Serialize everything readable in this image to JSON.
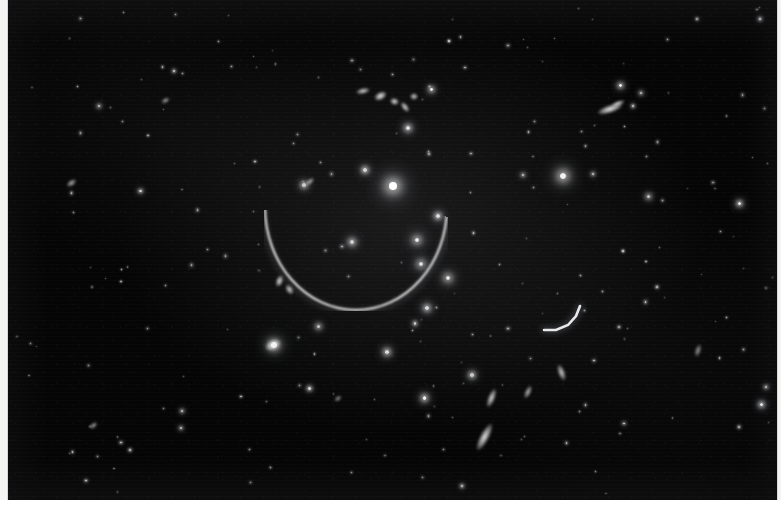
{
  "image": {
    "kind": "astronomical-photograph",
    "subject": "galaxy cluster with gravitational lensing arcs",
    "plate": {
      "x": 8,
      "y": 0,
      "width": 769,
      "height": 500,
      "background_color": "#050505",
      "border_color": "#d8d8d4"
    },
    "page_background_color": "#ffffff",
    "paper_tint_color": "#f4f4f2",
    "star_color": "#ffffff",
    "arc_color": "#f2f4f8",
    "caption": ""
  },
  "features": {
    "giant_arc": {
      "name": "giant-tangential-arc",
      "cx": 348,
      "cy": 207,
      "rx": 92,
      "ry": 104,
      "start_deg": 96,
      "end_deg": 268,
      "brightness": "bright"
    },
    "arc_knots": [
      {
        "x": 372,
        "y": 96,
        "w": 13,
        "h": 8,
        "rot": -28,
        "b": 0.95
      },
      {
        "x": 386,
        "y": 101,
        "w": 9,
        "h": 7,
        "rot": 15,
        "b": 0.9
      },
      {
        "x": 397,
        "y": 107,
        "w": 12,
        "h": 6,
        "rot": 52,
        "b": 0.88
      },
      {
        "x": 406,
        "y": 96,
        "w": 8,
        "h": 7,
        "rot": 0,
        "b": 0.8
      },
      {
        "x": 355,
        "y": 91,
        "w": 14,
        "h": 6,
        "rot": -12,
        "b": 0.85
      },
      {
        "x": 271,
        "y": 281,
        "w": 7,
        "h": 12,
        "rot": 20,
        "b": 0.9
      },
      {
        "x": 281,
        "y": 289,
        "w": 11,
        "h": 7,
        "rot": 58,
        "b": 0.82
      }
    ],
    "secondary_arc": {
      "name": "secondary-arc-right",
      "points": "M 572,306 L 568,316 L 560,325 L 548,330 L 536,330",
      "brightness": "medium"
    },
    "brightest_cluster_galaxy": {
      "x": 385,
      "y": 186,
      "size": 26,
      "brightness": 1.0
    },
    "bright_galaxies": [
      {
        "x": 385,
        "y": 186,
        "s": 26,
        "b": 1.0
      },
      {
        "x": 555,
        "y": 176,
        "s": 21,
        "b": 0.95
      },
      {
        "x": 409,
        "y": 240,
        "s": 16,
        "b": 0.92
      },
      {
        "x": 413,
        "y": 264,
        "s": 14,
        "b": 0.88
      },
      {
        "x": 440,
        "y": 278,
        "s": 15,
        "b": 0.9
      },
      {
        "x": 400,
        "y": 128,
        "s": 12,
        "b": 0.86
      },
      {
        "x": 430,
        "y": 216,
        "s": 11,
        "b": 0.84
      },
      {
        "x": 266,
        "y": 345,
        "s": 18,
        "b": 0.88
      },
      {
        "x": 344,
        "y": 242,
        "s": 13,
        "b": 0.82
      },
      {
        "x": 379,
        "y": 352,
        "s": 12,
        "b": 0.86
      },
      {
        "x": 419,
        "y": 308,
        "s": 12,
        "b": 0.84
      },
      {
        "x": 296,
        "y": 185,
        "s": 11,
        "b": 0.78
      },
      {
        "x": 310,
        "y": 326,
        "s": 10,
        "b": 0.8
      },
      {
        "x": 357,
        "y": 170,
        "s": 11,
        "b": 0.82
      },
      {
        "x": 464,
        "y": 375,
        "s": 11,
        "b": 0.78
      },
      {
        "x": 640,
        "y": 196,
        "s": 10,
        "b": 0.78
      }
    ],
    "field_stars_count": 120,
    "edge_on_galaxies": [
      {
        "x": 602,
        "y": 109,
        "w": 26,
        "h": 8,
        "rot": -18,
        "b": 0.95
      },
      {
        "x": 476,
        "y": 437,
        "w": 9,
        "h": 30,
        "rot": 28,
        "b": 0.9
      },
      {
        "x": 483,
        "y": 398,
        "w": 7,
        "h": 20,
        "rot": 22,
        "b": 0.85
      },
      {
        "x": 553,
        "y": 372,
        "w": 7,
        "h": 17,
        "rot": -20,
        "b": 0.8
      },
      {
        "x": 63,
        "y": 183,
        "w": 11,
        "h": 6,
        "rot": -35,
        "b": 0.7
      },
      {
        "x": 157,
        "y": 100,
        "w": 9,
        "h": 5,
        "rot": -30,
        "b": 0.66
      },
      {
        "x": 610,
        "y": 103,
        "w": 14,
        "h": 5,
        "rot": -20,
        "b": 0.9
      },
      {
        "x": 302,
        "y": 181,
        "w": 10,
        "h": 5,
        "rot": -40,
        "b": 0.7
      },
      {
        "x": 85,
        "y": 425,
        "w": 9,
        "h": 5,
        "rot": -40,
        "b": 0.68
      },
      {
        "x": 330,
        "y": 398,
        "w": 8,
        "h": 5,
        "rot": -35,
        "b": 0.6
      },
      {
        "x": 265,
        "y": 345,
        "w": 16,
        "h": 10,
        "rot": -25,
        "b": 0.85
      },
      {
        "x": 520,
        "y": 392,
        "w": 6,
        "h": 14,
        "rot": 25,
        "b": 0.72
      },
      {
        "x": 690,
        "y": 350,
        "w": 6,
        "h": 13,
        "rot": 18,
        "b": 0.6
      }
    ]
  }
}
